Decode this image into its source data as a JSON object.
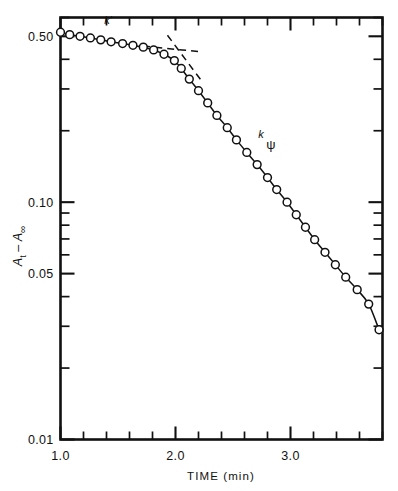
{
  "chart_data": {
    "type": "scatter",
    "title": "",
    "subtitle": "",
    "xlabel": "TIME (min)",
    "ylabel": "A t  −  A ∞",
    "ylabel_parts": {
      "symbol1": "A",
      "sub1": "t",
      "minus": "−",
      "symbol2": "A",
      "sub2": "∞"
    },
    "xscale": "linear",
    "yscale": "log",
    "xlim": [
      1.0,
      3.8
    ],
    "ylim": [
      0.01,
      0.6
    ],
    "grid": false,
    "legend": "none",
    "xticklabels": [
      "1.0",
      "2.0",
      "3.0"
    ],
    "xtickvalues": [
      1.0,
      2.0,
      3.0
    ],
    "xminor_step": 0.2,
    "yticklabels": [
      "0.50",
      "0.10",
      "0.05",
      "0.01"
    ],
    "ytickvalues": [
      0.5,
      0.1,
      0.05,
      0.01
    ],
    "series": [
      {
        "name": "A_t - A_inf",
        "marker": "open-circle",
        "x": [
          1.0,
          1.08,
          1.17,
          1.26,
          1.35,
          1.44,
          1.54,
          1.63,
          1.72,
          1.81,
          1.9,
          1.99,
          2.05,
          2.12,
          2.2,
          2.28,
          2.36,
          2.45,
          2.53,
          2.62,
          2.71,
          2.8,
          2.88,
          2.97,
          3.05,
          3.13,
          3.21,
          3.3,
          3.39,
          3.48,
          3.58,
          3.68,
          3.77
        ],
        "y": [
          0.52,
          0.508,
          0.5,
          0.492,
          0.483,
          0.474,
          0.466,
          0.458,
          0.45,
          0.438,
          0.42,
          0.395,
          0.366,
          0.33,
          0.295,
          0.262,
          0.232,
          0.206,
          0.183,
          0.162,
          0.144,
          0.127,
          0.113,
          0.1,
          0.0885,
          0.0784,
          0.0695,
          0.0615,
          0.0545,
          0.0483,
          0.0428,
          0.0372,
          0.029
        ]
      }
    ],
    "fit_lines": [
      {
        "name": "k-prime-dashed",
        "style": "dashed",
        "x": [
          1.72,
          2.22
        ],
        "y": [
          0.455,
          0.43
        ]
      },
      {
        "name": "k-psi-dashed",
        "style": "dashed",
        "x": [
          1.93,
          2.24
        ],
        "y": [
          0.505,
          0.318
        ]
      }
    ],
    "annotations": [
      {
        "name": "k-prime",
        "text": "k′",
        "x": 1.38,
        "y": 0.565
      },
      {
        "name": "k-psi",
        "text_main": "k",
        "text_sub": "ψ",
        "x": 2.72,
        "y": 0.187
      }
    ]
  },
  "axis": {
    "x_label": "TIME (min)",
    "x_ticks": [
      "1.0",
      "2.0",
      "3.0"
    ],
    "y_ticks": [
      "0.50",
      "0.10",
      "0.05",
      "0.01"
    ],
    "y_label_symbol_a": "A",
    "y_label_sub_t": "t",
    "y_label_minus": "–",
    "y_label_symbol_a2": "A",
    "y_label_sub_inf": "∞"
  },
  "annotations": {
    "k_prime": "k′",
    "k_main": "k",
    "k_sub": "ψ"
  },
  "colors": {
    "ink": "#111111",
    "paper": "#ffffff"
  }
}
